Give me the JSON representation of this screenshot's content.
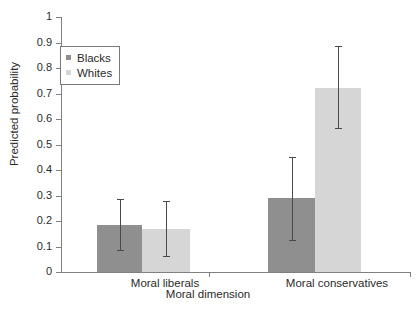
{
  "chart_data": {
    "type": "bar",
    "title": "",
    "xlabel": "Moral dimension",
    "ylabel": "Predicted probability",
    "categories": [
      "Moral liberals",
      "Moral conservatives"
    ],
    "ylim": [
      0,
      1
    ],
    "yticks": [
      "0",
      "0.1",
      "0.2",
      "0.3",
      "0.4",
      "0.5",
      "0.6",
      "0.7",
      "0.8",
      "0.9",
      "1"
    ],
    "grid": false,
    "legend_position": "upper-left",
    "series": [
      {
        "name": "Blacks",
        "color": "#8f8f8f",
        "values": [
          0.185,
          0.29
        ],
        "error_low": [
          0.085,
          0.125
        ],
        "error_high": [
          0.285,
          0.45
        ]
      },
      {
        "name": "Whites",
        "color": "#d6d6d6",
        "values": [
          0.17,
          0.72
        ],
        "error_low": [
          0.063,
          0.563
        ],
        "error_high": [
          0.278,
          0.885
        ]
      }
    ]
  },
  "axis": {
    "y_title": "Predicted probability",
    "x_title": "Moral dimension"
  },
  "legend": {
    "entries": [
      {
        "label": "Blacks",
        "swatch": "dark-gray-square"
      },
      {
        "label": "Whites",
        "swatch": "light-gray-square"
      }
    ]
  }
}
